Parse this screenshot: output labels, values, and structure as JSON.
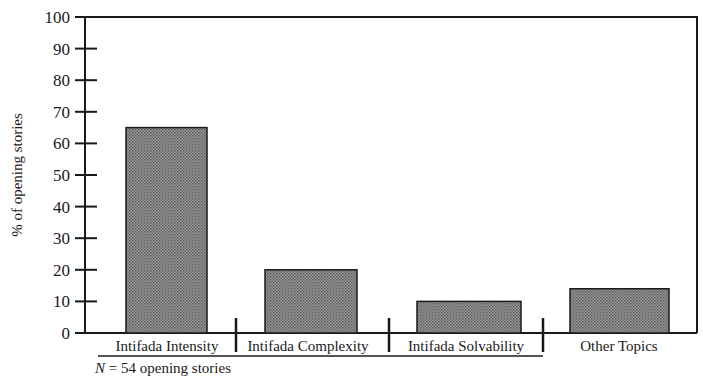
{
  "chart_data": {
    "type": "bar",
    "title": "",
    "xlabel": "",
    "ylabel": "% of opening stories",
    "ylim": [
      0,
      100
    ],
    "yticks": [
      0,
      10,
      20,
      30,
      40,
      50,
      60,
      70,
      80,
      90,
      100
    ],
    "grid": false,
    "legend": null,
    "categories": [
      "Intifada Intensity",
      "Intifada Complexity",
      "Intifada Solvability",
      "Other Topics"
    ],
    "values": [
      65,
      20,
      10,
      14
    ],
    "category_group": {
      "members": [
        "Intifada Intensity",
        "Intifada Complexity",
        "Intifada Solvability"
      ],
      "underlined": true
    },
    "annotation": "N = 54 opening stories",
    "bar_fill": "#8a8a8a",
    "bar_edge": "#1a1a1a"
  },
  "labels": {
    "ylabel": "% of opening stories",
    "note_n": "N",
    "note_rest": " = 54 opening stories"
  }
}
